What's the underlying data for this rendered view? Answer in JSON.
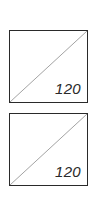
{
  "cells": [
    {
      "value": "120",
      "diagonal": "bottom-left-to-top-right"
    },
    {
      "value": "120",
      "diagonal": "bottom-left-to-top-right"
    }
  ],
  "colors": {
    "border": "#2a2a2a",
    "diagonal": "#9a9a9a",
    "background": "#ffffff"
  }
}
